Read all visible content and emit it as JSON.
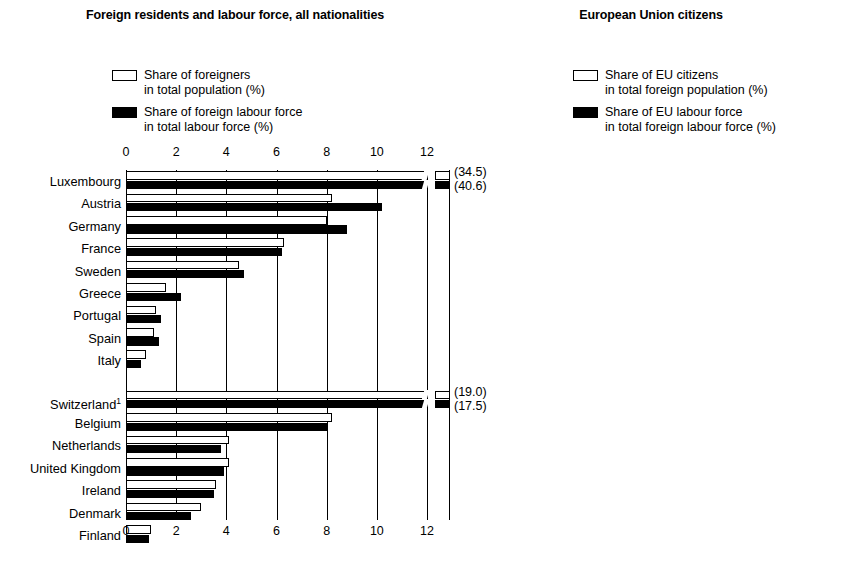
{
  "left": {
    "title": "Foreign residents and labour force,\nall nationalities",
    "legend": [
      {
        "swatch": "open",
        "text": "Share of foreigners\nin total population (%)"
      },
      {
        "swatch": "filled",
        "text": "Share of foreign labour force\nin total labour force (%)"
      }
    ],
    "axis": {
      "ticks": [
        "0",
        "2",
        "4",
        "6",
        "8",
        "10",
        "12"
      ],
      "min": 0,
      "max": 12,
      "step": 2
    }
  },
  "right": {
    "title": "European Union\ncitizens",
    "legend": [
      {
        "swatch": "open",
        "text": "Share of EU citizens\nin total foreign population (%)"
      },
      {
        "swatch": "filled",
        "text": "Share of EU labour force\nin total foreign labour force (%)"
      }
    ],
    "axis": {
      "ticks": [
        "0",
        "10",
        "20",
        "30",
        "40",
        "50",
        "60",
        "70",
        "80",
        "90"
      ],
      "min": 0,
      "max": 90,
      "step": 10
    }
  },
  "chart_data": [
    {
      "type": "bar",
      "orientation": "horizontal",
      "title": "Foreign residents and labour force, all nationalities",
      "xlabel": "",
      "ylabel": "",
      "xlim": [
        0,
        12
      ],
      "grid": true,
      "legend": [
        "Share of foreigners in total population (%)",
        "Share of foreign labour force in total labour force (%)"
      ],
      "groups": [
        {
          "name": "group-1",
          "categories": [
            "Luxembourg",
            "Austria",
            "Germany",
            "France",
            "Sweden",
            "Greece",
            "Portugal",
            "Spain",
            "Italy"
          ],
          "series": [
            {
              "name": "Share of foreigners in total population (%)",
              "values": [
                34.5,
                8.2,
                8.0,
                6.3,
                4.5,
                1.6,
                1.2,
                1.1,
                0.8
              ]
            },
            {
              "name": "Share of foreign labour force in total labour force (%)",
              "values": [
                40.6,
                10.2,
                8.8,
                6.2,
                4.7,
                2.2,
                1.4,
                1.3,
                0.6
              ]
            }
          ],
          "annotations": [
            {
              "category": "Luxembourg",
              "labels": [
                "(34.5)",
                "(40.6)"
              ],
              "note": "axis-break, bars exceed 12% scale"
            }
          ]
        },
        {
          "name": "group-2",
          "categories": [
            "Switzerland¹",
            "Belgium",
            "Netherlands",
            "United Kingdom",
            "Ireland",
            "Denmark",
            "Finland"
          ],
          "series": [
            {
              "name": "Share of foreigners in total population (%)",
              "values": [
                19.0,
                8.2,
                4.1,
                4.1,
                3.6,
                3.0,
                1.0
              ]
            },
            {
              "name": "Share of foreign labour force in total labour force (%)",
              "values": [
                17.5,
                8.0,
                3.8,
                3.9,
                3.5,
                2.6,
                0.9
              ]
            }
          ],
          "annotations": [
            {
              "category": "Switzerland¹",
              "labels": [
                "(19.0)",
                "(17.5)"
              ],
              "note": "axis-break, bars exceed 12% scale"
            }
          ]
        }
      ]
    },
    {
      "type": "bar",
      "orientation": "horizontal",
      "title": "European Union citizens",
      "xlabel": "",
      "ylabel": "",
      "xlim": [
        0,
        90
      ],
      "grid": true,
      "legend": [
        "Share of EU citizens in total foreign population (%)",
        "Share of EU labour force in total foreign labour force (%)"
      ],
      "groups": [
        {
          "name": "group-1",
          "categories": [
            "Luxembourg",
            "Ireland",
            "Belgium",
            "Switzerland¹",
            "United Kingdom",
            "France",
            "Netherlands",
            "Sweden",
            "Denmark",
            "Germany"
          ],
          "series": [
            {
              "name": "Share of EU citizens in total foreign population (%)",
              "values": [
                88,
                84,
                73,
                63,
                47,
                40,
                38,
                37,
                31,
                30
              ]
            },
            {
              "name": "Share of EU labour force in total foreign labour force (%)",
              "values": [
                90,
                86,
                76,
                67,
                47,
                42,
                47,
                44,
                37,
                34
              ]
            }
          ]
        },
        {
          "name": "group-2",
          "categories": [
            "Spain",
            "Portugal",
            "Finland",
            "Austria",
            "Italy",
            "Greece"
          ],
          "series": [
            {
              "name": "Share of EU citizens in total foreign population (%)",
              "values": [
                50,
                25,
                19,
                18,
                17,
                12
              ]
            },
            {
              "name": "Share of EU labour force in total foreign labour force (%)",
              "values": [
                44,
                21,
                16,
                15,
                15,
                10
              ]
            }
          ]
        }
      ]
    }
  ]
}
